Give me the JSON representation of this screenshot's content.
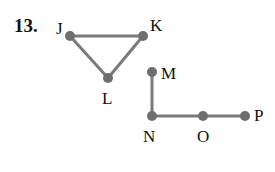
{
  "problem_number": "13.",
  "colors": {
    "edge": "#7a7a7a",
    "vertex": "#6e6e6e",
    "text": "#111111"
  },
  "graph": {
    "vertices": [
      {
        "id": "J",
        "label": "J",
        "x": 70,
        "y": 36,
        "lx": 56,
        "ly": 20
      },
      {
        "id": "K",
        "label": "K",
        "x": 143,
        "y": 36,
        "lx": 150,
        "ly": 17
      },
      {
        "id": "L",
        "label": "L",
        "x": 108,
        "y": 78,
        "lx": 102,
        "ly": 90
      },
      {
        "id": "M",
        "label": "M",
        "x": 152,
        "y": 72,
        "lx": 161,
        "ly": 65
      },
      {
        "id": "N",
        "label": "N",
        "x": 152,
        "y": 116,
        "lx": 143,
        "ly": 128
      },
      {
        "id": "O",
        "label": "O",
        "x": 203,
        "y": 116,
        "lx": 197,
        "ly": 128
      },
      {
        "id": "P",
        "label": "P",
        "x": 245,
        "y": 116,
        "lx": 254,
        "ly": 107
      }
    ],
    "edges": [
      [
        "J",
        "K"
      ],
      [
        "J",
        "L"
      ],
      [
        "K",
        "L"
      ],
      [
        "M",
        "N"
      ],
      [
        "N",
        "O"
      ],
      [
        "O",
        "P"
      ]
    ]
  }
}
